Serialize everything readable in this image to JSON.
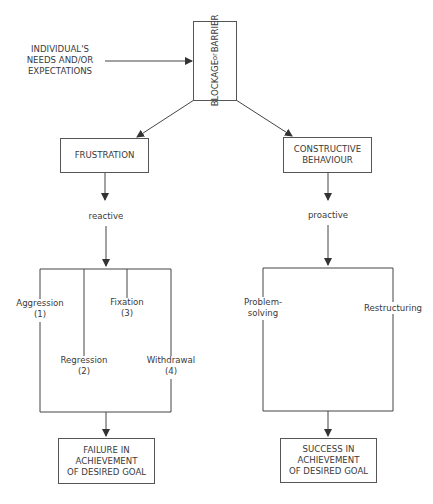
{
  "diagram": {
    "input_label": [
      "INDIVIDUAL'S",
      "NEEDS AND/OR",
      "EXPECTATIONS"
    ],
    "blockage": [
      "BLOCKAGE",
      "or",
      "BARRIER"
    ],
    "left": {
      "box": "FRUSTRATION",
      "arrow_label": "reactive",
      "responses": [
        {
          "name": "Aggression",
          "num": "(1)"
        },
        {
          "name": "Regression",
          "num": "(2)"
        },
        {
          "name": "Fixation",
          "num": "(3)"
        },
        {
          "name": "Withdrawal",
          "num": "(4)"
        }
      ],
      "outcome": [
        "FAILURE IN",
        "ACHIEVEMENT",
        "OF DESIRED GOAL"
      ]
    },
    "right": {
      "box": [
        "CONSTRUCTIVE",
        "BEHAVIOUR"
      ],
      "arrow_label": "proactive",
      "responses": [
        {
          "name": [
            "Problem-",
            "solving"
          ]
        },
        {
          "name": "Restructuring"
        }
      ],
      "outcome": [
        "SUCCESS IN",
        "ACHIEVEMENT",
        "OF DESIRED GOAL"
      ]
    }
  },
  "colors": {
    "line": "#444444",
    "text": "#3a3a3a",
    "background": "#ffffff"
  }
}
